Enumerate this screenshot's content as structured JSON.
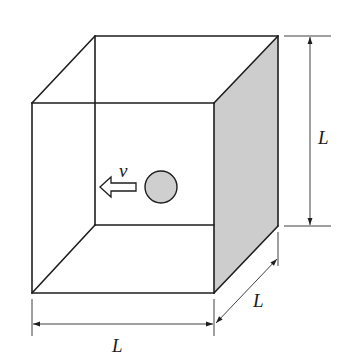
{
  "figure": {
    "type": "cube with moving ball",
    "colors": {
      "edge": "#1e1e1e",
      "shaded_face": "#cdcdcd",
      "ball_fill": "#cfcfcf",
      "background": "#ffffff"
    }
  },
  "labels": {
    "height": "L",
    "width": "L",
    "depth": "L",
    "velocity": "v"
  },
  "ball": {
    "cx": 161,
    "cy": 187,
    "r": 16
  },
  "arrow": {
    "direction": "left",
    "symbol": "hollow-arrow"
  }
}
